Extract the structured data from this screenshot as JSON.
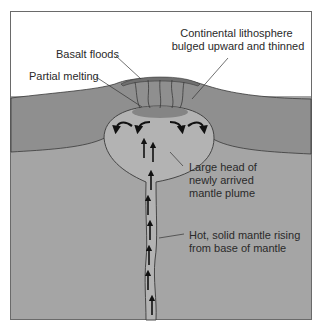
{
  "figure": {
    "colors": {
      "background": "#ffffff",
      "sky": "#ffffff",
      "lithosphere": "#8f8f8f",
      "mantle": "#a5a5a5",
      "plume": "#b3b3b3",
      "partial_melt": "#7d7d7d",
      "basalt": "#8a8a8a",
      "outline": "#3a3a3a",
      "arrow": "#111111",
      "text": "#2a2a2a"
    },
    "labels": {
      "basalt_floods": "Basalt floods",
      "partial_melting": "Partial melting",
      "lithosphere_line1": "Continental lithosphere",
      "lithosphere_line2": "bulged upward and thinned",
      "plume_head_line1": "Large head of",
      "plume_head_line2": "newly arrived",
      "plume_head_line3": "mantle plume",
      "plume_tail_line1": "Hot, solid mantle rising",
      "plume_tail_line2": "from base of mantle"
    },
    "arrows": {
      "head_flow": [
        "curl-left-outer",
        "curl-left-inner",
        "curl-right-inner",
        "curl-right-outer"
      ],
      "upward_count": 10
    }
  }
}
